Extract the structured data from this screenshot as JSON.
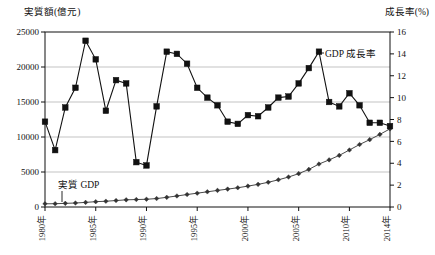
{
  "chart_data": {
    "type": "line",
    "title": "",
    "xlabel": "",
    "x": [
      1980,
      1981,
      1982,
      1983,
      1984,
      1985,
      1986,
      1987,
      1988,
      1989,
      1990,
      1991,
      1992,
      1993,
      1994,
      1995,
      1996,
      1997,
      1998,
      1999,
      2000,
      2001,
      2002,
      2003,
      2004,
      2005,
      2006,
      2007,
      2008,
      2009,
      2010,
      2011,
      2012,
      2013,
      2014
    ],
    "xtick_labels": [
      "1980年",
      "1985年",
      "1990年",
      "1995年",
      "2000年",
      "2005年",
      "2010年",
      "2014年"
    ],
    "xtick_values": [
      1980,
      1985,
      1990,
      1995,
      2000,
      2005,
      2010,
      2014
    ],
    "grid": true,
    "legend_position": "inline-annotation",
    "left_axis": {
      "label": "実質額(億元)",
      "unit": "億元",
      "ylim": [
        0,
        25000
      ],
      "ticks": [
        0,
        5000,
        10000,
        15000,
        20000,
        25000
      ],
      "tick_labels": [
        "0",
        "5000",
        "10000",
        "15000",
        "20000",
        "25000"
      ]
    },
    "right_axis": {
      "label": "成長率(%)",
      "unit": "%",
      "ylim": [
        0,
        16
      ],
      "ticks": [
        0,
        2,
        4,
        6,
        8,
        10,
        12,
        14,
        16
      ],
      "tick_labels": [
        "0",
        "2",
        "4",
        "6",
        "8",
        "10",
        "12",
        "14",
        "16"
      ]
    },
    "series": [
      {
        "name": "実質 GDP",
        "axis": "left",
        "marker": "diamond",
        "color": "#333333",
        "annotation": "実質 GDP",
        "values": [
          455,
          470,
          520,
          570,
          660,
          760,
          825,
          920,
          1025,
          1065,
          1105,
          1205,
          1380,
          1575,
          1780,
          1975,
          2170,
          2370,
          2555,
          2750,
          2985,
          3235,
          3530,
          3885,
          4280,
          4765,
          5370,
          6135,
          6730,
          7370,
          8145,
          8925,
          9620,
          10370,
          11165
        ]
      },
      {
        "name": "GDP 成長率",
        "axis": "right",
        "marker": "square",
        "color": "#111111",
        "annotation": "GDP 成長率",
        "values": [
          7.8,
          5.2,
          9.1,
          10.9,
          15.2,
          13.5,
          8.8,
          11.6,
          11.3,
          4.1,
          3.8,
          9.2,
          14.2,
          14.0,
          13.1,
          10.9,
          10.0,
          9.3,
          7.8,
          7.6,
          8.4,
          8.3,
          9.1,
          10.0,
          10.1,
          11.3,
          12.7,
          14.2,
          9.6,
          9.2,
          10.4,
          9.3,
          7.7,
          7.7,
          7.4
        ]
      }
    ]
  }
}
